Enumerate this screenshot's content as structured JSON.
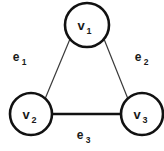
{
  "figure": {
    "name": "undirected-triangle-graph",
    "background_color": "#ffffff",
    "width": 164,
    "height": 151
  },
  "style": {
    "node_stroke_color": "#111111",
    "node_fill_color": "#ffffff",
    "node_stroke_width": 2.6,
    "thin_edge_color": "#3a3a3a",
    "thin_edge_width": 1.2,
    "thick_edge_color": "#111111",
    "thick_edge_width": 2.4,
    "text_color": "#1a1a1a"
  },
  "nodes": [
    {
      "id": "v1",
      "label_base": "v",
      "label_sub": "1",
      "cx": 87,
      "cy": 25,
      "r": 22
    },
    {
      "id": "v2",
      "label_base": "v",
      "label_sub": "2",
      "cx": 31,
      "cy": 114,
      "r": 21
    },
    {
      "id": "v3",
      "label_base": "v",
      "label_sub": "3",
      "cx": 142,
      "cy": 114,
      "r": 21
    }
  ],
  "edges": [
    {
      "id": "e1",
      "label_base": "e",
      "label_sub": "1",
      "from": "v1",
      "to": "v2",
      "x1": 70,
      "y1": 39,
      "x2": 45,
      "y2": 99,
      "weight": "thin",
      "label_x": 16,
      "label_y": 61
    },
    {
      "id": "e2",
      "label_base": "e",
      "label_sub": "2",
      "from": "v1",
      "to": "v3",
      "x1": 104,
      "y1": 39,
      "x2": 128,
      "y2": 99,
      "weight": "thin",
      "label_x": 138,
      "label_y": 61
    },
    {
      "id": "e3",
      "label_base": "e",
      "label_sub": "3",
      "from": "v2",
      "to": "v3",
      "x1": 52,
      "y1": 114,
      "x2": 121,
      "y2": 114,
      "weight": "thick",
      "label_x": 80,
      "label_y": 139
    }
  ]
}
